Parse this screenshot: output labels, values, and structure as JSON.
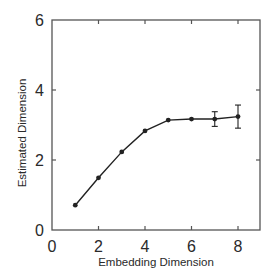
{
  "chart_data": {
    "type": "line",
    "title": "",
    "xlabel": "Embedding Dimension",
    "ylabel": "Estimated Dimension",
    "xlim": [
      0,
      9
    ],
    "ylim": [
      0,
      6
    ],
    "xticks": [
      0,
      2,
      4,
      6,
      8
    ],
    "yticks": [
      0,
      2,
      4,
      6
    ],
    "grid": false,
    "legend": null,
    "series": [
      {
        "name": "Estimated Dimension",
        "marker": "circle",
        "color": "#222222",
        "x": [
          1,
          2,
          3,
          4,
          5,
          6,
          7,
          8
        ],
        "y": [
          0.71,
          1.49,
          2.23,
          2.83,
          3.14,
          3.17,
          3.17,
          3.24
        ],
        "error": [
          0,
          0,
          0,
          0,
          0,
          0,
          0.21,
          0.33
        ]
      }
    ]
  },
  "colors": {
    "axis": "#555555",
    "line": "#222222",
    "text": "#2a2a2a",
    "background": "#ffffff"
  }
}
